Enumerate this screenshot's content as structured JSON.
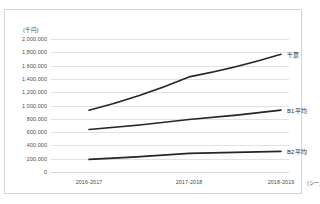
{
  "chart_data": {
    "type": "line",
    "title": "",
    "subtitle": "",
    "xlabel": "(シーズン)",
    "ylabel": "(千円)",
    "categories": [
      "2016-2017",
      "2017-2018",
      "2018-2019"
    ],
    "ylim": [
      0,
      2000000
    ],
    "ytick_values": [
      0,
      200000,
      400000,
      600000,
      800000,
      1000000,
      1200000,
      1400000,
      1600000,
      1800000,
      2000000
    ],
    "ytick_labels": [
      "0",
      "200,000",
      "400,000",
      "600,000",
      "800,000",
      "1,000,000",
      "1,200,000",
      "1,400,000",
      "1,600,000",
      "1,800,000",
      "2,000,000"
    ],
    "grid": true,
    "legend_position": "right-inline",
    "series": [
      {
        "name": "千葉",
        "label": "千葉",
        "color": "#262626",
        "values": [
          930000,
          1430000,
          1770000
        ]
      },
      {
        "name": "B1平均",
        "label": "B1平均",
        "color": "#262626",
        "values": [
          640000,
          790000,
          930000
        ]
      },
      {
        "name": "B2平均",
        "label": "B2平均",
        "color": "#262626",
        "values": [
          190000,
          280000,
          310000
        ]
      }
    ]
  },
  "axis": {
    "y_unit_label": "(千円)",
    "x_unit_label": "(シーズン)"
  },
  "colors": {
    "line": "#262626",
    "grid": "#e2e2e2",
    "frame_border": "#d4d4d4",
    "tick_text": "#4a4a4a",
    "label_text": "#2b2b2b",
    "background": "#ffffff"
  }
}
